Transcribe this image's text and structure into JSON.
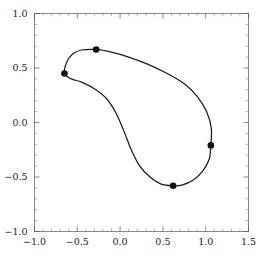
{
  "chart_data": {
    "type": "line",
    "title": "",
    "subtitle": "",
    "xlabel": "",
    "ylabel": "",
    "xlim": [
      -1.0,
      1.5
    ],
    "ylim": [
      -1.0,
      1.0
    ],
    "grid": false,
    "legend": null,
    "background_color": "#ffffff",
    "curve_color": "#1c1c1c",
    "point_color": "#111111",
    "frame_color": "#555555",
    "x_ticks_major": [
      -1.0,
      -0.5,
      0.0,
      0.5,
      1.0,
      1.5
    ],
    "x_tick_labels": [
      "-1.0",
      "-0.5",
      "0.0",
      "0.5",
      "1.0",
      "1.5"
    ],
    "y_ticks_major": [
      -1.0,
      -0.5,
      0.0,
      0.5,
      1.0
    ],
    "y_tick_labels": [
      "-1.0",
      "-0.5",
      "0.0",
      "0.5",
      "1.0"
    ],
    "x_minor_step": 0.1,
    "y_minor_step": 0.1,
    "points": [
      {
        "label": "P1",
        "x": -0.65,
        "y": 0.45
      },
      {
        "label": "P2",
        "x": -0.28,
        "y": 0.67
      },
      {
        "label": "P3",
        "x": 1.06,
        "y": -0.21
      },
      {
        "label": "P4",
        "x": 0.62,
        "y": -0.58
      }
    ],
    "curve_samples": [
      {
        "x": -0.65,
        "y": 0.45
      },
      {
        "x": -0.62,
        "y": 0.56
      },
      {
        "x": -0.55,
        "y": 0.63
      },
      {
        "x": -0.45,
        "y": 0.665
      },
      {
        "x": -0.28,
        "y": 0.67
      },
      {
        "x": -0.1,
        "y": 0.645
      },
      {
        "x": 0.1,
        "y": 0.6
      },
      {
        "x": 0.32,
        "y": 0.535
      },
      {
        "x": 0.55,
        "y": 0.45
      },
      {
        "x": 0.75,
        "y": 0.355
      },
      {
        "x": 0.9,
        "y": 0.24
      },
      {
        "x": 1.01,
        "y": 0.1
      },
      {
        "x": 1.065,
        "y": -0.05
      },
      {
        "x": 1.06,
        "y": -0.21
      },
      {
        "x": 1.04,
        "y": -0.34
      },
      {
        "x": 0.96,
        "y": -0.45
      },
      {
        "x": 0.85,
        "y": -0.53
      },
      {
        "x": 0.72,
        "y": -0.575
      },
      {
        "x": 0.62,
        "y": -0.58
      },
      {
        "x": 0.48,
        "y": -0.565
      },
      {
        "x": 0.35,
        "y": -0.5
      },
      {
        "x": 0.23,
        "y": -0.4
      },
      {
        "x": 0.13,
        "y": -0.25
      },
      {
        "x": 0.04,
        "y": -0.07
      },
      {
        "x": -0.05,
        "y": 0.09
      },
      {
        "x": -0.16,
        "y": 0.22
      },
      {
        "x": -0.3,
        "y": 0.31
      },
      {
        "x": -0.45,
        "y": 0.37
      },
      {
        "x": -0.57,
        "y": 0.4
      },
      {
        "x": -0.65,
        "y": 0.45
      }
    ]
  },
  "axes": {
    "x_axis_name": "horizontal-axis",
    "y_axis_name": "vertical-axis"
  }
}
